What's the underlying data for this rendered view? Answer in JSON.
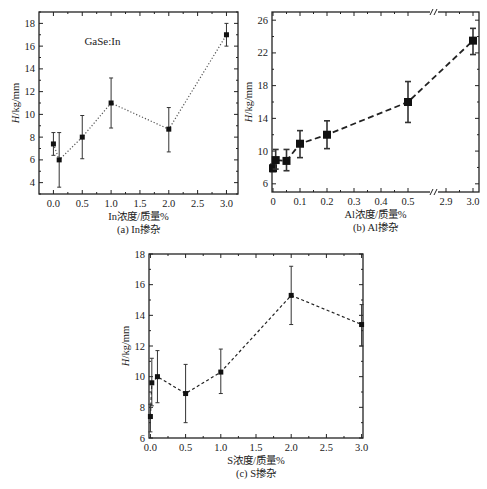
{
  "chart_data": [
    {
      "id": "a",
      "type": "scatter",
      "title": "",
      "caption": "(a) In掺杂",
      "annotation": "GaSe:In",
      "xlabel": "In浓度/质量%",
      "ylabel": "H/kg/mm",
      "xlim": [
        -0.25,
        3.2
      ],
      "ylim": [
        3.0,
        19.0
      ],
      "xticks": [
        0.0,
        0.5,
        1.0,
        1.5,
        2.0,
        2.5,
        3.0
      ],
      "xtick_labels": [
        "0.0",
        "0.5",
        "1.0",
        "1.5",
        "2.0",
        "2.5",
        "3.0"
      ],
      "yticks": [
        4,
        6,
        8,
        10,
        12,
        14,
        16,
        18
      ],
      "ytick_labels": [
        "4",
        "6",
        "8",
        "10",
        "12",
        "14",
        "16",
        "18"
      ],
      "line_style": "dotted",
      "marker": "square-small",
      "grid": false,
      "series": [
        {
          "name": "GaSe:In",
          "x": [
            0.0,
            0.1,
            0.5,
            1.0,
            2.0,
            3.0
          ],
          "y": [
            7.4,
            6.0,
            8.0,
            11.0,
            8.7,
            17.0
          ],
          "err_low": [
            6.4,
            3.6,
            6.1,
            8.8,
            6.7,
            16.0
          ],
          "err_high": [
            8.4,
            8.4,
            9.9,
            13.2,
            10.6,
            18.0
          ]
        }
      ]
    },
    {
      "id": "b",
      "type": "scatter",
      "title": "",
      "caption": "(b) Al掺杂",
      "xlabel": "Al浓度/质量%",
      "ylabel": "H/kg/mm",
      "x_axis_break": {
        "from": 0.55,
        "to": 2.85
      },
      "xlim": [
        0.0,
        3.02
      ],
      "ylim": [
        5.0,
        27.0
      ],
      "xticks": [
        0,
        0.1,
        0.2,
        0.3,
        0.4,
        0.5,
        2.9,
        3.0
      ],
      "xtick_labels": [
        "0",
        "0.1",
        "0.2",
        "0.3",
        "0.4",
        "0.5",
        "2.9",
        "3.0"
      ],
      "yticks": [
        6,
        10,
        14,
        18,
        22,
        26
      ],
      "ytick_labels": [
        "6",
        "10",
        "14",
        "18",
        "22",
        "26"
      ],
      "line_style": "dashed",
      "marker": "square-large",
      "grid": false,
      "series": [
        {
          "name": "Al",
          "x": [
            0.0,
            0.01,
            0.05,
            0.1,
            0.2,
            0.5,
            3.0
          ],
          "y": [
            7.9,
            8.9,
            8.8,
            10.9,
            12.0,
            16.0,
            23.5
          ],
          "err_low": [
            7.5,
            7.8,
            7.6,
            9.2,
            10.3,
            13.5,
            21.8
          ],
          "err_high": [
            8.4,
            10.2,
            10.2,
            12.5,
            13.7,
            18.5,
            25.0
          ]
        }
      ]
    },
    {
      "id": "c",
      "type": "scatter",
      "title": "",
      "caption": "(c) S掺杂",
      "xlabel": "S浓度/质量%",
      "ylabel": "H/kg/mm",
      "xlim": [
        -0.02,
        3.02
      ],
      "ylim": [
        6.0,
        18.0
      ],
      "xticks": [
        0.0,
        0.5,
        1.0,
        1.5,
        2.0,
        2.5,
        3.0
      ],
      "xtick_labels": [
        "0.0",
        "0.5",
        "1.0",
        "1.5",
        "2.0",
        "2.5",
        "3.0"
      ],
      "yticks": [
        6,
        8,
        10,
        12,
        14,
        16,
        18
      ],
      "ytick_labels": [
        "6",
        "8",
        "10",
        "12",
        "14",
        "16",
        "18"
      ],
      "line_style": "dashed-short",
      "marker": "square-small",
      "grid": false,
      "series": [
        {
          "name": "S",
          "x": [
            0.0,
            0.02,
            0.1,
            0.5,
            1.0,
            2.0,
            3.0
          ],
          "y": [
            7.4,
            9.6,
            10.0,
            8.9,
            10.3,
            15.3,
            13.4
          ],
          "err_low": [
            6.4,
            8.1,
            8.3,
            7.0,
            8.9,
            13.4,
            12.0
          ],
          "err_high": [
            8.2,
            11.2,
            11.7,
            10.8,
            11.8,
            17.2,
            14.7
          ]
        }
      ]
    }
  ],
  "layout": {
    "a": {
      "left": 39,
      "top": 12,
      "right": 238,
      "bottom": 194
    },
    "b": {
      "left": 272,
      "top": 12,
      "right": 479,
      "bottom": 192,
      "seg1_end_px": 410,
      "seg2_start_px": 446
    },
    "c": {
      "left": 149,
      "top": 254,
      "right": 363,
      "bottom": 438
    }
  }
}
